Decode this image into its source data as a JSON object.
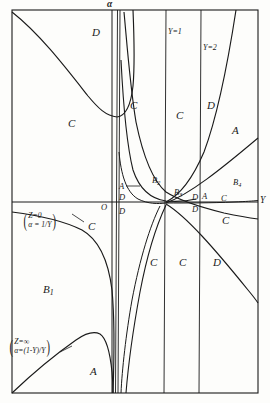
{
  "figure": {
    "background_color": "#fdfdfb",
    "line_color": "#1a1a1a",
    "frame": {
      "x": 12,
      "y": 10,
      "width": 246,
      "height": 383
    }
  },
  "axes": {
    "vertical_axis_label": "α",
    "horizontal_axis_label": "Y",
    "origin_label": "O",
    "vertical_axis_x": 112,
    "horizontal_axis_y": 202
  },
  "isoclines": [
    {
      "name": "Y=1",
      "label": "Y=1",
      "x": 165
    },
    {
      "name": "Y=2",
      "label": "Y=2",
      "x": 200
    }
  ],
  "annotations": [
    {
      "name": "z-zero-annotation",
      "line1": "Z=0",
      "line2": "α = 1/Y",
      "x": 22,
      "y": 212
    },
    {
      "name": "z-infinity-annotation",
      "line1": "Z=∞",
      "line2": "α=(1-Y)/Y",
      "x": 8,
      "y": 338
    }
  ],
  "region_labels": [
    {
      "name": "region-d-topleft",
      "text": "D",
      "base": "D",
      "sub": "",
      "x": 92,
      "y": 27,
      "size": "region"
    },
    {
      "name": "region-c-left",
      "text": "C",
      "base": "C",
      "sub": "",
      "x": 68,
      "y": 118,
      "size": "region"
    },
    {
      "name": "region-c-mid1",
      "text": "C",
      "base": "C",
      "sub": "",
      "x": 130,
      "y": 100,
      "size": "region"
    },
    {
      "name": "region-c-mid2",
      "text": "C",
      "base": "C",
      "sub": "",
      "x": 176,
      "y": 110,
      "size": "region"
    },
    {
      "name": "region-d-mid",
      "text": "D",
      "base": "D",
      "sub": "",
      "x": 207,
      "y": 100,
      "size": "region"
    },
    {
      "name": "region-a-upperright",
      "text": "A",
      "base": "A",
      "sub": "",
      "x": 232,
      "y": 125,
      "size": "region"
    },
    {
      "name": "region-b2",
      "text": "B2",
      "base": "B",
      "sub": "2",
      "x": 152,
      "y": 176,
      "size": "small"
    },
    {
      "name": "region-b3",
      "text": "B3",
      "base": "B",
      "sub": "3",
      "x": 174,
      "y": 188,
      "size": "small"
    },
    {
      "name": "region-b4",
      "text": "B4",
      "base": "B",
      "sub": "4",
      "x": 233,
      "y": 178,
      "size": "small"
    },
    {
      "name": "region-a-axis-left",
      "text": "A",
      "base": "A",
      "sub": "",
      "x": 119,
      "y": 182,
      "size": "small"
    },
    {
      "name": "region-d-left-above",
      "text": "D",
      "base": "D",
      "sub": "",
      "x": 119,
      "y": 193,
      "size": "small"
    },
    {
      "name": "region-d-left-below",
      "text": "D",
      "base": "D",
      "sub": "",
      "x": 119,
      "y": 207,
      "size": "small"
    },
    {
      "name": "region-d-right-above",
      "text": "D",
      "base": "D",
      "sub": "",
      "x": 192,
      "y": 193,
      "size": "small"
    },
    {
      "name": "region-a-right",
      "text": "A",
      "base": "A",
      "sub": "",
      "x": 202,
      "y": 192,
      "size": "small"
    },
    {
      "name": "region-d-right-below",
      "text": "D",
      "base": "D",
      "sub": "",
      "x": 192,
      "y": 205,
      "size": "small"
    },
    {
      "name": "region-c-right-axis",
      "text": "C",
      "base": "C",
      "sub": "",
      "x": 221,
      "y": 194,
      "size": "small"
    },
    {
      "name": "region-c-belowaxis-left",
      "text": "C",
      "base": "C",
      "sub": "",
      "x": 88,
      "y": 221,
      "size": "region"
    },
    {
      "name": "region-c-belowaxis-right",
      "text": "C",
      "base": "C",
      "sub": "",
      "x": 222,
      "y": 215,
      "size": "region"
    },
    {
      "name": "region-c-lower1",
      "text": "C",
      "base": "C",
      "sub": "",
      "x": 150,
      "y": 257,
      "size": "region"
    },
    {
      "name": "region-c-lower2",
      "text": "C",
      "base": "C",
      "sub": "",
      "x": 179,
      "y": 257,
      "size": "region"
    },
    {
      "name": "region-d-lower",
      "text": "D",
      "base": "D",
      "sub": "",
      "x": 213,
      "y": 257,
      "size": "region"
    },
    {
      "name": "region-b1",
      "text": "B1",
      "base": "B",
      "sub": "1",
      "x": 43,
      "y": 284,
      "size": "region"
    },
    {
      "name": "region-a-bottom",
      "text": "A",
      "base": "A",
      "sub": "",
      "x": 90,
      "y": 366,
      "size": "region"
    }
  ],
  "chart_data": {
    "type": "line",
    "xlabel": "Y",
    "ylabel": "α",
    "grid": false,
    "legend": "none",
    "xlim": [
      -2.6,
      4.4
    ],
    "ylim": [
      -3.6,
      2.2
    ],
    "vertical_asymptotes": [
      0,
      0.06,
      1,
      2
    ],
    "labelled_curves": [
      {
        "name": "Z=0 locus",
        "expression": "α = 1/Y",
        "label": "(Z=0, α=1/Y)"
      },
      {
        "name": "Z=infinity locus",
        "expression": "α = (1-Y)/Y",
        "label": "(Z=∞, α=(1-Y)/Y)"
      }
    ],
    "regions": [
      "A",
      "B1",
      "B2",
      "B3",
      "B4",
      "C",
      "D"
    ],
    "isocline_labels": [
      "Y=1",
      "Y=2"
    ]
  }
}
